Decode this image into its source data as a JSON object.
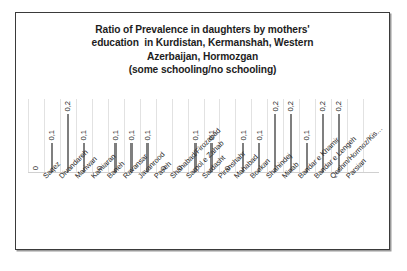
{
  "chart_data": {
    "type": "bar",
    "title": "Ratio of Prevalence in daughters by mothers' education  in Kurdistan, Kermanshah, Western Azerbaijan, Hormozgan (some schooling/no schooling)",
    "title_lines": [
      "Ratio of Prevalence in daughters by mothers'",
      "education  in Kurdistan, Kermanshah, Western",
      "Azerbaijan, Hormozgan",
      "(some schooling/no schooling)"
    ],
    "xlabel": "",
    "ylabel": "",
    "ylim": [
      0,
      0.25
    ],
    "grid": true,
    "legend": false,
    "bar_color": "#7f7f7f",
    "gridline_color": "#e2e2e2",
    "categories": [
      "Saqez",
      "Divandareh",
      "Mariwan",
      "Kamiaran",
      "Baneh",
      "Ravansar",
      "Javanrood",
      "Paveh",
      "Shahabad/Firozabad",
      "Sarpol e Zahab",
      "Sardasht",
      "Piranshahr",
      "Mahabad",
      "Bookan",
      "Shahindej",
      "Minab",
      "Bandar e Khamir",
      "Bandar e Lengeh",
      "Qeshm/Hormoz/Kis…",
      "Parsian"
    ],
    "values": [
      0,
      0.1,
      0.2,
      0.1,
      0,
      0.1,
      0.1,
      0.1,
      0,
      0,
      0.1,
      0.1,
      0,
      0.1,
      0.1,
      0.2,
      0.2,
      0.1,
      0.2,
      0.2
    ],
    "value_labels": [
      "0",
      "0,1",
      "0,2",
      "0,1",
      "0",
      "0,1",
      "0,1",
      "0,1",
      "0",
      "0",
      "0,1",
      "0,1",
      "0",
      "0,1",
      "0,1",
      "0,2",
      "0,2",
      "0,1",
      "0,2",
      "0,2"
    ]
  }
}
